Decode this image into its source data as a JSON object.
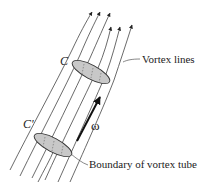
{
  "diagram": {
    "title": "Vortex tube",
    "labels": {
      "curve_top": "C",
      "curve_bottom": "C'",
      "vorticity": "ω",
      "vortex_lines": "Vortex lines",
      "boundary": "Boundary of vortex tube"
    },
    "colors": {
      "line": "#444444",
      "cross_section_fill": "#c8c8c8",
      "cross_section_stroke": "#333333",
      "vorticity_arrow": "#111111",
      "text": "#222222"
    },
    "vortex_line_count": 7
  }
}
